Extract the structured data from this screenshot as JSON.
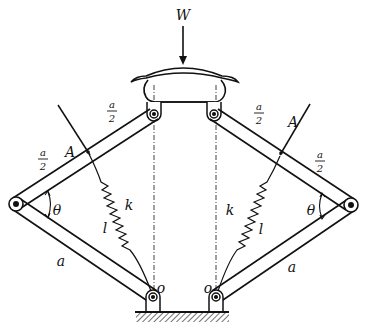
{
  "diagram": {
    "load": {
      "label": "W",
      "description": "downward vertical force applied at top of platform"
    },
    "labels": {
      "half_upper_left": {
        "num": "a",
        "den": "2"
      },
      "half_lower_left": {
        "num": "a",
        "den": "2"
      },
      "half_upper_right": {
        "num": "a",
        "den": "2"
      },
      "half_lower_right": {
        "num": "a",
        "den": "2"
      },
      "point_left": "A",
      "point_right": "A",
      "angle_left": "θ",
      "angle_right": "θ",
      "spring_left_k": "k",
      "spring_left_l": "l",
      "spring_right_k": "k",
      "spring_right_l": "l",
      "bar_left": "a",
      "bar_right": "a",
      "pivot_left": "o",
      "pivot_right": "o"
    },
    "components": [
      "top platform (curved cap)",
      "two upper pins on platform",
      "two upper links of length a (each split a/2 + a/2 at point A)",
      "two outer elbow pins",
      "two lower links of length a",
      "two ground pivots O",
      "two springs of stiffness k and natural length l from A to O",
      "two vertical dash-dot centerlines",
      "hatched ground"
    ],
    "colors": {
      "stroke": "#111111",
      "background": "#ffffff"
    }
  }
}
